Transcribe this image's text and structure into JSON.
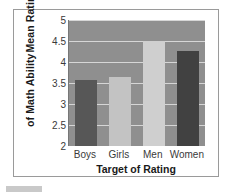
{
  "chart_data": {
    "type": "bar",
    "title": "",
    "categories": [
      "Boys",
      "Girls",
      "Men",
      "Women"
    ],
    "values": [
      3.57,
      3.65,
      4.5,
      4.27
    ],
    "series": [
      {
        "name": "Mean Rating of Math Ability",
        "values": [
          3.57,
          3.65,
          4.5,
          4.27
        ]
      }
    ],
    "xlabel": "Target of Rating",
    "ylabel_line1": "Mean Rating",
    "ylabel_line2": "of Math Ability",
    "ylim": [
      2,
      5
    ],
    "yticks": [
      2,
      2.5,
      3,
      3.5,
      4,
      4.5,
      5
    ],
    "ytick_labels": [
      "2",
      "2.5",
      "3",
      "3.5",
      "4",
      "4.5",
      "5"
    ],
    "grid": true,
    "legend": "none",
    "bar_colors": [
      "#575757",
      "#c3c3c3",
      "#cfcfcf",
      "#414141"
    ],
    "plot_background": "#8f8f8f",
    "gridline_color": "#d6d6d6",
    "frame_color": "#9a9a9a",
    "text_color": "#1a1a1a"
  }
}
